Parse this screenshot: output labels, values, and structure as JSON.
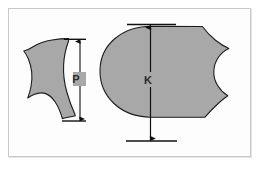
{
  "figure": {
    "background_color": "#ffffff",
    "frame_color": "#c9c9c9",
    "frame_shadow_color": "#e4e4e4",
    "shape_fill_color": "#a8a8a8",
    "shape_outline_color": "#1c1c1c",
    "dimension_line_color": "#111111"
  },
  "shapes": [
    {
      "id": "small-profile",
      "name": "small-profile-shape",
      "fill": "#a8a8a8",
      "outline": "#1c1c1c"
    },
    {
      "id": "large-profile",
      "name": "large-profile-shape",
      "fill": "#a8a8a8",
      "outline": "#1c1c1c"
    }
  ],
  "dimensions": [
    {
      "id": "p-dimension",
      "label": "P",
      "orientation": "vertical",
      "arrow_style": "double-ended",
      "measures": "small-profile-shape"
    },
    {
      "id": "k-dimension",
      "label": "K",
      "orientation": "vertical",
      "arrow_style": "double-ended",
      "measures": "large-profile-shape"
    }
  ]
}
